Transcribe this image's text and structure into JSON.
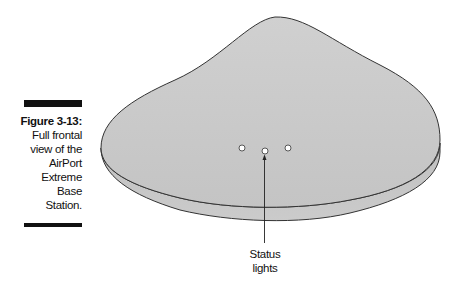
{
  "caption": {
    "figure_number": "Figure 3-13:",
    "lines": [
      "Full frontal",
      "view of the",
      "AirPort",
      "Extreme",
      "Base",
      "Station."
    ]
  },
  "illustration": {
    "subject": "AirPort Extreme Base Station",
    "status_light_count": 3,
    "fill_color": "#c9c9c9",
    "outline_color": "#333333"
  },
  "callout": {
    "lines": [
      "Status",
      "lights"
    ]
  }
}
